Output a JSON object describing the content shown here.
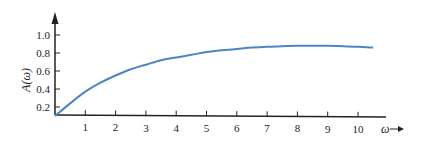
{
  "chart_data": {
    "type": "line",
    "title": "",
    "xlabel": "ω",
    "ylabel": "A(ω)",
    "x_ticks": [
      "1",
      "2",
      "3",
      "4",
      "5",
      "6",
      "7",
      "8",
      "9",
      "10"
    ],
    "y_ticks": [
      "0.2",
      "0.4",
      "0.6",
      "0.8",
      "1.0"
    ],
    "xlim": [
      0,
      10.5
    ],
    "ylim": [
      0.1,
      1.0
    ],
    "grid": false,
    "legend": null,
    "series": [
      {
        "name": "A(ω)",
        "color": "#4a86c5",
        "x": [
          0,
          0.5,
          1,
          1.5,
          2,
          2.5,
          3,
          3.5,
          4,
          4.5,
          5,
          5.5,
          6,
          6.5,
          7,
          7.5,
          8,
          8.5,
          9,
          9.5,
          10,
          10.5
        ],
        "y": [
          0.1,
          0.24,
          0.37,
          0.47,
          0.55,
          0.62,
          0.67,
          0.72,
          0.75,
          0.78,
          0.81,
          0.83,
          0.845,
          0.86,
          0.87,
          0.875,
          0.88,
          0.88,
          0.88,
          0.875,
          0.87,
          0.86
        ]
      }
    ]
  },
  "labels": {
    "ylabel": "A(ω)",
    "xlabel": "ω"
  }
}
